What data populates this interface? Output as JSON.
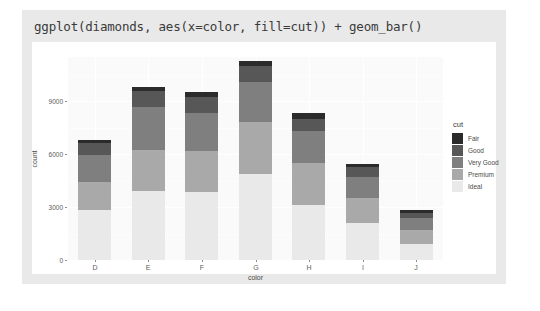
{
  "title": "ggplot(diamonds, aes(x=color, fill=cut)) + geom_bar()",
  "legend": {
    "title": "cut",
    "items": [
      {
        "label": "Fair",
        "color": "#2b2b2b"
      },
      {
        "label": "Good",
        "color": "#575757"
      },
      {
        "label": "Very Good",
        "color": "#7f7f7f"
      },
      {
        "label": "Premium",
        "color": "#a9a9a9"
      },
      {
        "label": "Ideal",
        "color": "#e9e9e9"
      }
    ]
  },
  "chart_data": {
    "type": "bar",
    "stacked": true,
    "title": "ggplot(diamonds, aes(x=color, fill=cut)) + geom_bar()",
    "xlabel": "color",
    "ylabel": "count",
    "categories": [
      "D",
      "E",
      "F",
      "G",
      "H",
      "I",
      "J"
    ],
    "yticks": [
      0,
      3000,
      6000,
      9000
    ],
    "ytick_labels": [
      "0",
      "3000",
      "6000",
      "9000"
    ],
    "ylim": [
      0,
      11500
    ],
    "grid": true,
    "legend_position": "right",
    "series": [
      {
        "name": "Fair",
        "color": "#2b2b2b",
        "values": [
          163,
          224,
          312,
          314,
          303,
          175,
          119
        ]
      },
      {
        "name": "Good",
        "color": "#575757",
        "values": [
          662,
          933,
          909,
          871,
          702,
          522,
          307
        ]
      },
      {
        "name": "Very Good",
        "color": "#7f7f7f",
        "values": [
          1513,
          2400,
          2164,
          2299,
          1824,
          1204,
          678
        ]
      },
      {
        "name": "Premium",
        "color": "#a9a9a9",
        "values": [
          1603,
          2337,
          2331,
          2924,
          2360,
          1428,
          808
        ]
      },
      {
        "name": "Ideal",
        "color": "#e9e9e9",
        "values": [
          2834,
          3903,
          3826,
          4884,
          3115,
          2093,
          896
        ]
      }
    ],
    "totals": [
      6775,
      9797,
      9542,
      11292,
      8304,
      5422,
      2808
    ]
  }
}
